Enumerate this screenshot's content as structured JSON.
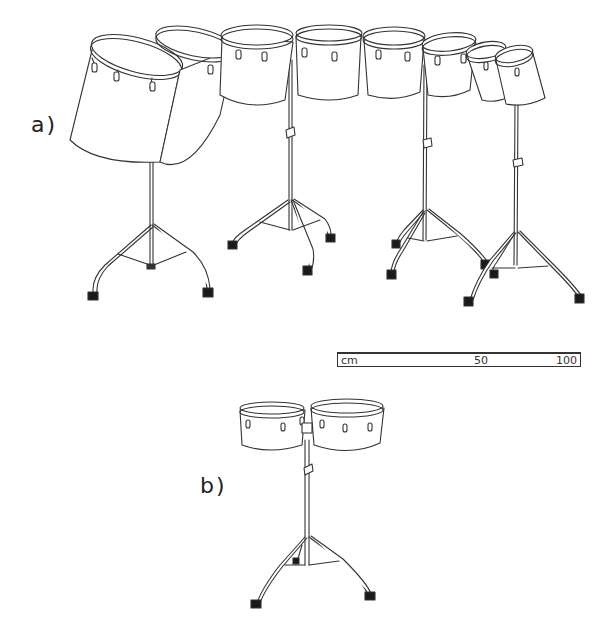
{
  "figure": {
    "panels": [
      {
        "id": "a",
        "label": "a)",
        "description": "Set of eight concert toms / roto-toms mounted on four double-braced tripod stands, two drums per stand, arranged in a descending arc"
      },
      {
        "id": "b",
        "label": "b)",
        "description": "Pair of timbales on a single tripod stand"
      }
    ],
    "scale_bar": {
      "unit": "cm",
      "mid_label": "50",
      "max_label": "100"
    },
    "colors": {
      "line": "#333333",
      "background": "#ffffff",
      "foot": "#1a1a1a"
    }
  }
}
